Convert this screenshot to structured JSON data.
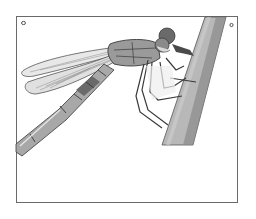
{
  "illustration": {
    "subject": "insect perched on plant stem",
    "style": "grayscale stippled line drawing",
    "frame": {
      "border_color": "#6a6a6a",
      "background": "#ffffff"
    },
    "corner_marks": [
      "top-left",
      "top-right"
    ],
    "colors": {
      "stem": "#b8b8b8",
      "stem_shadow": "#7a7a7a",
      "body": "#9a9a9a",
      "body_dark": "#5a5a5a",
      "wing": "#e6e6e6",
      "wing_vein": "#8a8a8a",
      "outline": "#3a3a3a"
    }
  }
}
